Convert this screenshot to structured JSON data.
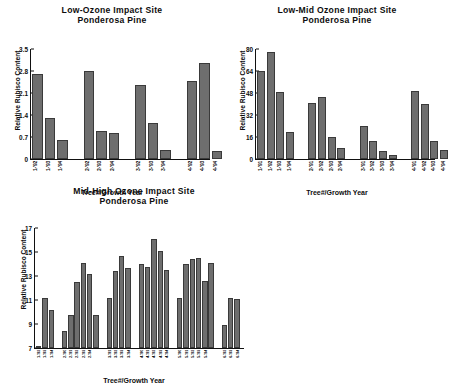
{
  "figure": {
    "axis_title_x": "Tree#/Growth Year",
    "axis_title_y": "Relative Rubisco Content",
    "bar_color": "#6e6e6e",
    "axis_color": "#111111"
  },
  "chart_data": [
    {
      "type": "bar",
      "title": "Low-Ozone Impact Site",
      "subtitle": "Ponderosa Pine",
      "xlabel": "Tree#/Growth Year",
      "ylabel": "Relative Rubisco Content",
      "ylim": [
        0,
        3.5
      ],
      "yticks": [
        "0",
        "0.7",
        "1.4",
        "2.1",
        "2.8",
        "3.5"
      ],
      "ytick_values": [
        0,
        0.7,
        1.4,
        2.1,
        2.8,
        3.5
      ],
      "grid": false,
      "legend": "none",
      "groups": [
        {
          "name": "1",
          "categories": [
            "1-'92",
            "1-'93",
            "1-'94"
          ],
          "values": [
            2.72,
            1.3,
            0.62
          ]
        },
        {
          "name": "2",
          "categories": [
            "2-'92",
            "2-'93",
            "2-'94"
          ],
          "values": [
            2.8,
            0.9,
            0.85
          ]
        },
        {
          "name": "3",
          "categories": [
            "3-'92",
            "3-'93",
            "3-'94"
          ],
          "values": [
            2.35,
            1.15,
            0.3
          ]
        },
        {
          "name": "4",
          "categories": [
            "4-'92",
            "4-'93",
            "4-'94"
          ],
          "values": [
            2.5,
            3.05,
            0.25
          ]
        }
      ]
    },
    {
      "type": "bar",
      "title": "Low-Mid Ozone Impact Site",
      "subtitle": "Ponderosa Pine",
      "xlabel": "Tree#/Growth Year",
      "ylabel": "Relative Rubisco Content",
      "ylim": [
        0,
        80
      ],
      "yticks": [
        "0",
        "16",
        "32",
        "48",
        "64",
        "80"
      ],
      "ytick_values": [
        0,
        16,
        32,
        48,
        64,
        80
      ],
      "grid": false,
      "legend": "none",
      "groups": [
        {
          "name": "1",
          "categories": [
            "1-'91",
            "1-'92",
            "1-'93",
            "1-'94"
          ],
          "values": [
            64,
            78,
            49,
            19.5
          ]
        },
        {
          "name": "2",
          "categories": [
            "2-'91",
            "2-'92",
            "2-'93",
            "2-'94"
          ],
          "values": [
            41,
            45,
            16.5,
            8
          ]
        },
        {
          "name": "3",
          "categories": [
            "3-'91",
            "3-'92",
            "3-'93",
            "3-'94"
          ],
          "values": [
            24,
            13.5,
            6,
            3
          ]
        },
        {
          "name": "4",
          "categories": [
            "4-'91",
            "4-'92",
            "4-'93",
            "4-'94"
          ],
          "values": [
            49.5,
            40,
            13.5,
            7
          ]
        }
      ]
    },
    {
      "type": "bar",
      "title": "Mid-High Ozone Impact Site",
      "subtitle": "Ponderosa Pine",
      "xlabel": "Tree#/Growth Year",
      "ylabel": "Relative Rubisco Content",
      "ylim": [
        7,
        17
      ],
      "yticks": [
        "7",
        "9",
        "11",
        "13",
        "15",
        "17"
      ],
      "ytick_values": [
        7,
        9,
        11,
        13,
        15,
        17
      ],
      "grid": false,
      "legend": "none",
      "groups": [
        {
          "name": "1",
          "categories": [
            "1-'92",
            "1-'93",
            "1-'94"
          ],
          "values": [
            7.2,
            11.15,
            10.2
          ]
        },
        {
          "name": "2",
          "categories": [
            "2-'90",
            "2-'91",
            "2-'92",
            "2-'93",
            "2-'94"
          ],
          "values": [
            8.4,
            9.8,
            12.5,
            14.1,
            13.2,
            9.8
          ]
        },
        {
          "name": "3",
          "categories": [
            "3-'91",
            "3-'92",
            "3-'93",
            "3-'94"
          ],
          "values": [
            11.2,
            13.4,
            14.7,
            13.7
          ]
        },
        {
          "name": "4",
          "categories": [
            "4-'90",
            "4-'91",
            "4-'92",
            "4-'93",
            "4-'94"
          ],
          "values": [
            14.0,
            13.8,
            16.1,
            15.1,
            13.5
          ]
        },
        {
          "name": "5",
          "categories": [
            "5-'90",
            "5-'91",
            "5-'92",
            "5-'93",
            "5-'94"
          ],
          "values": [
            11.2,
            14.0,
            14.4,
            14.5,
            12.6,
            14.1
          ]
        },
        {
          "name": "6",
          "categories": [
            "6-'92",
            "6-'93",
            "6-'94"
          ],
          "values": [
            8.95,
            11.2,
            11.1
          ]
        }
      ]
    }
  ]
}
